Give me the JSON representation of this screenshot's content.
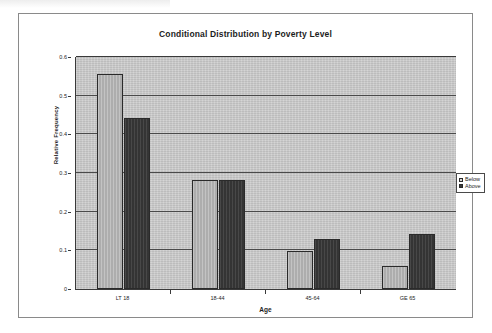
{
  "chart_data": {
    "type": "bar",
    "title": "Conditional Distribution by Poverty Level",
    "xlabel": "Age",
    "ylabel": "Relative Frequency",
    "categories": [
      "LT 18",
      "18-44",
      "45-64",
      "GE 65"
    ],
    "series": [
      {
        "name": "Below",
        "color": "#b4b4b4",
        "values": [
          0.555,
          0.283,
          0.099,
          0.06
        ]
      },
      {
        "name": "Above",
        "color": "#3a3a3a",
        "values": [
          0.442,
          0.281,
          0.129,
          0.141
        ]
      }
    ],
    "ylim": [
      0,
      0.6
    ],
    "yticks": [
      0,
      0.1,
      0.2,
      0.3,
      0.4,
      0.5,
      0.6
    ],
    "ytick_labels": [
      "0",
      "0.1",
      "0.2",
      "0.3",
      "0.4",
      "0.5",
      "0.6"
    ],
    "grid": true,
    "legend_position": "right",
    "legend_entries": [
      "Below",
      "Above"
    ],
    "plot_background": "#c9c9c9",
    "frame_color": "#8a8a8a"
  }
}
